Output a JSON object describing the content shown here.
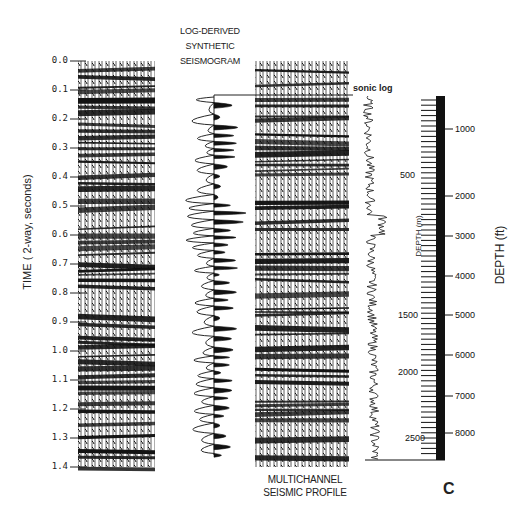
{
  "figure": {
    "panel_letter": "C",
    "time_axis": {
      "label": "TIME ( 2-way, seconds)",
      "ticks": [
        "0.0",
        "0.1",
        "0.2",
        "0.3",
        "0.4",
        "0.5",
        "0.6",
        "0.7",
        "0.8",
        "0.9",
        "1.0",
        "1.1",
        "1.2",
        "1.3",
        "1.4"
      ],
      "range": [
        0.0,
        1.4
      ]
    },
    "synthetic": {
      "title_line1": "LOG-DERIVED",
      "title_line2": "SYNTHETIC",
      "title_line3": "SEISMOGRAM"
    },
    "seismic_profile": {
      "label_line1": "MULTICHANNEL",
      "label_line2": "SEISMIC PROFILE"
    },
    "sonic_log": {
      "label": "sonic log"
    },
    "depth_m_axis": {
      "label": "DEPTH (m)",
      "ticks": [
        "500",
        "1500",
        "2000",
        "2500"
      ]
    },
    "depth_ft_axis": {
      "label": "DEPTH (ft)",
      "ticks": [
        "1000",
        "2000",
        "3000",
        "4000",
        "5000",
        "6000",
        "7000",
        "8000"
      ]
    }
  },
  "chart_data": {
    "type": "line",
    "xlabel": "",
    "ylabel": "TIME ( 2-way, seconds)",
    "ylim": [
      0.0,
      1.4
    ],
    "y_ticks": [
      0.0,
      0.1,
      0.2,
      0.3,
      0.4,
      0.5,
      0.6,
      0.7,
      0.8,
      0.9,
      1.0,
      1.1,
      1.2,
      1.3,
      1.4
    ],
    "panels": [
      "seismic section (left)",
      "LOG-DERIVED SYNTHETIC SEISMOGRAM",
      "MULTICHANNEL SEISMIC PROFILE",
      "sonic log"
    ],
    "depth_m_ticks": [
      500,
      1500,
      2000,
      2500
    ],
    "depth_ft_ticks": [
      1000,
      2000,
      3000,
      4000,
      5000,
      6000,
      7000,
      8000
    ],
    "legend": [],
    "grid": false
  }
}
